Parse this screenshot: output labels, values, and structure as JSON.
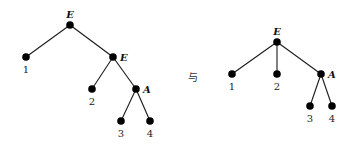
{
  "connector_text": "与",
  "trees": [
    {
      "name": "tree-left",
      "nodes": [
        {
          "id": "L-E1",
          "label": "E",
          "kind": "internal",
          "label_side": "top"
        },
        {
          "id": "L-1",
          "label": "1",
          "kind": "leaf"
        },
        {
          "id": "L-E2",
          "label": "E",
          "kind": "internal",
          "label_side": "right"
        },
        {
          "id": "L-2",
          "label": "2",
          "kind": "leaf"
        },
        {
          "id": "L-A",
          "label": "A",
          "kind": "internal",
          "label_side": "right"
        },
        {
          "id": "L-3",
          "label": "3",
          "kind": "leaf"
        },
        {
          "id": "L-4",
          "label": "4",
          "kind": "leaf"
        }
      ],
      "edges": [
        [
          "L-E1",
          "L-1"
        ],
        [
          "L-E1",
          "L-E2"
        ],
        [
          "L-E2",
          "L-2"
        ],
        [
          "L-E2",
          "L-A"
        ],
        [
          "L-A",
          "L-3"
        ],
        [
          "L-A",
          "L-4"
        ]
      ]
    },
    {
      "name": "tree-right",
      "nodes": [
        {
          "id": "R-E",
          "label": "E",
          "kind": "internal",
          "label_side": "top"
        },
        {
          "id": "R-1",
          "label": "1",
          "kind": "leaf"
        },
        {
          "id": "R-2",
          "label": "2",
          "kind": "leaf"
        },
        {
          "id": "R-A",
          "label": "A",
          "kind": "internal",
          "label_side": "right"
        },
        {
          "id": "R-3",
          "label": "3",
          "kind": "leaf"
        },
        {
          "id": "R-4",
          "label": "4",
          "kind": "leaf"
        }
      ],
      "edges": [
        [
          "R-E",
          "R-1"
        ],
        [
          "R-E",
          "R-2"
        ],
        [
          "R-E",
          "R-A"
        ],
        [
          "R-A",
          "R-3"
        ],
        [
          "R-A",
          "R-4"
        ]
      ]
    }
  ]
}
